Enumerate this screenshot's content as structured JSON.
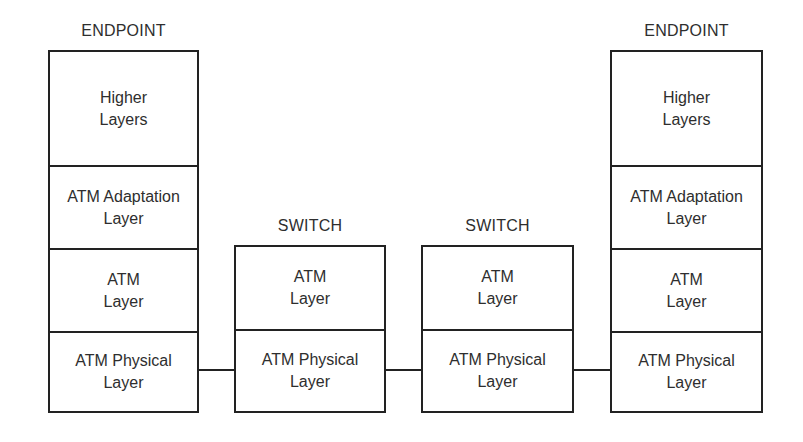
{
  "diagram": {
    "type": "ATM protocol stack across endpoints and switches",
    "nodes": [
      {
        "id": "endpoint-left",
        "title": "ENDPOINT",
        "layers": [
          {
            "label": "Higher\nLayers"
          },
          {
            "label": "ATM Adaptation\nLayer"
          },
          {
            "label": "ATM\nLayer"
          },
          {
            "label": "ATM Physical\nLayer"
          }
        ]
      },
      {
        "id": "switch-1",
        "title": "SWITCH",
        "layers": [
          {
            "label": "ATM\nLayer"
          },
          {
            "label": "ATM Physical\nLayer"
          }
        ]
      },
      {
        "id": "switch-2",
        "title": "SWITCH",
        "layers": [
          {
            "label": "ATM\nLayer"
          },
          {
            "label": "ATM Physical\nLayer"
          }
        ]
      },
      {
        "id": "endpoint-right",
        "title": "ENDPOINT",
        "layers": [
          {
            "label": "Higher\nLayers"
          },
          {
            "label": "ATM Adaptation\nLayer"
          },
          {
            "label": "ATM\nLayer"
          },
          {
            "label": "ATM Physical\nLayer"
          }
        ]
      }
    ],
    "links": [
      {
        "from": "endpoint-left",
        "to": "switch-1",
        "layer": "ATM Physical Layer"
      },
      {
        "from": "switch-1",
        "to": "switch-2",
        "layer": "ATM Physical Layer"
      },
      {
        "from": "switch-2",
        "to": "endpoint-right",
        "layer": "ATM Physical Layer"
      }
    ],
    "colors": {
      "line": "#222222",
      "text": "#2e2e2e",
      "background": "#ffffff"
    }
  }
}
